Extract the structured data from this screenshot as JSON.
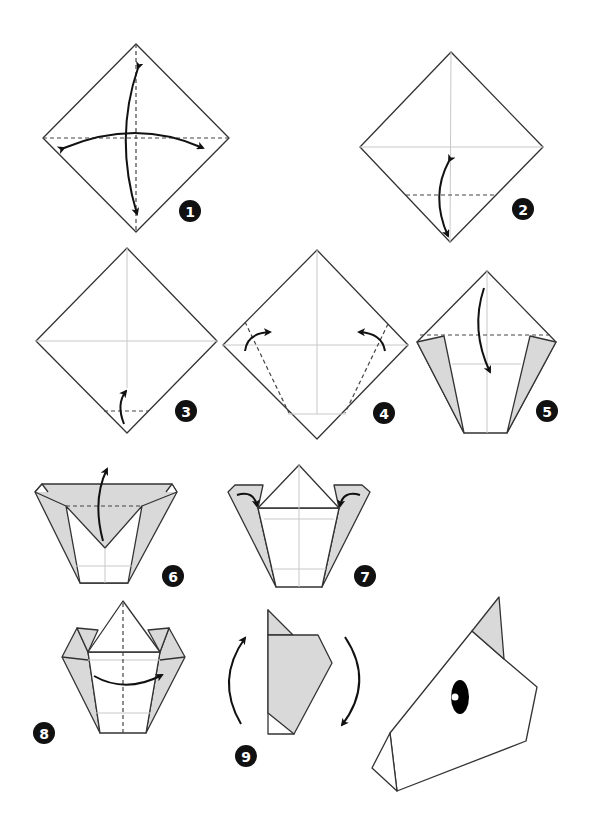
{
  "diagram": {
    "colors": {
      "paper": "#ffffff",
      "paper_back": "#d9d9d9",
      "line": "#333333",
      "badge": "#111111"
    },
    "steps": [
      {
        "number": "1",
        "description": "Fold and unfold both diagonals"
      },
      {
        "number": "2",
        "description": "Fold bottom corner to center and unfold"
      },
      {
        "number": "3",
        "description": "Fold bottom corner up to crease"
      },
      {
        "number": "4",
        "description": "Fold sides in along dashed lines"
      },
      {
        "number": "5",
        "description": "Fold top corner down"
      },
      {
        "number": "6",
        "description": "Fold flap back up"
      },
      {
        "number": "7",
        "description": "Fold small corners in"
      },
      {
        "number": "8",
        "description": "Fold in half"
      },
      {
        "number": "9",
        "description": "Rotate model"
      }
    ],
    "final": {
      "description": "Finished horse head",
      "eye": "black eye with white highlight"
    }
  }
}
